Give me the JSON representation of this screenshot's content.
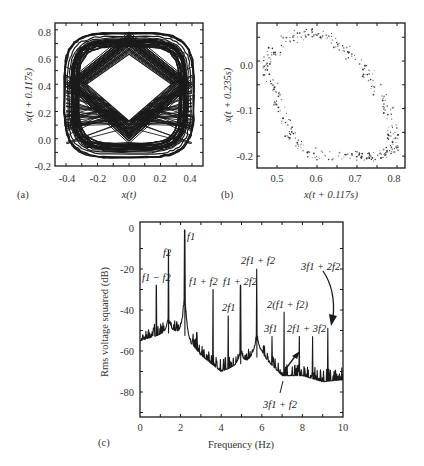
{
  "chart_data": [
    {
      "panel": "(a)",
      "type": "line",
      "title": "",
      "xlabel": "x(t)",
      "ylabel": "x(t + 0.117s)",
      "xlim": [
        -0.47,
        0.47
      ],
      "ylim": [
        -0.2,
        0.85
      ],
      "xticks": [
        "-0.4",
        "-0.2",
        "0.0",
        "0.2",
        "0.4"
      ],
      "yticks": [
        "-0.2",
        "0.0",
        "0.2",
        "0.4",
        "0.6",
        "0.8"
      ],
      "grid": false,
      "description": "Delay-coordinate phase portrait: dense quasi-periodic trajectory filling a rounded square band with a diamond-shaped empty center (vertices near (0,0.62), (0.27,0.4), (0,0.13), (-0.27,0.4))",
      "envelope": {
        "x_min": -0.42,
        "x_max": 0.42,
        "y_min": -0.15,
        "y_max": 0.81
      },
      "hole": [
        [
          0.0,
          0.62
        ],
        [
          0.27,
          0.4
        ],
        [
          0.0,
          0.13
        ],
        [
          -0.27,
          0.4
        ]
      ]
    },
    {
      "panel": "(b)",
      "type": "scatter",
      "title": "",
      "xlabel": "x(t + 0.117s)",
      "ylabel": "x(t + 0.235s)",
      "xlim": [
        0.45,
        0.82
      ],
      "ylim": [
        -0.225,
        0.08
      ],
      "xticks": [
        "0.5",
        "0.6",
        "0.7",
        "0.8"
      ],
      "yticks": [
        "-0.2",
        "-0.1",
        "0.0"
      ],
      "grid": false,
      "description": "Poincare section: scattered points forming a tilted closed ring (torus cross-section), densest near (0.77, -0.19)",
      "ring_points": [
        [
          0.48,
          0.0
        ],
        [
          0.5,
          0.03
        ],
        [
          0.54,
          0.05
        ],
        [
          0.58,
          0.06
        ],
        [
          0.62,
          0.05
        ],
        [
          0.66,
          0.03
        ],
        [
          0.7,
          0.0
        ],
        [
          0.74,
          -0.04
        ],
        [
          0.77,
          -0.09
        ],
        [
          0.79,
          -0.14
        ],
        [
          0.79,
          -0.18
        ],
        [
          0.76,
          -0.2
        ],
        [
          0.7,
          -0.2
        ],
        [
          0.63,
          -0.2
        ],
        [
          0.57,
          -0.19
        ],
        [
          0.54,
          -0.16
        ],
        [
          0.52,
          -0.12
        ],
        [
          0.5,
          -0.07
        ],
        [
          0.48,
          -0.03
        ]
      ]
    },
    {
      "panel": "(c)",
      "type": "line",
      "title": "",
      "xlabel": "Frequency (Hz)",
      "ylabel": "Rms voltage squared (dB)",
      "xlim": [
        0,
        10
      ],
      "ylim": [
        -92,
        2
      ],
      "xticks": [
        "0",
        "2",
        "4",
        "6",
        "8",
        "10"
      ],
      "yticks": [
        "0",
        "-20",
        "-40",
        "-60",
        "-80"
      ],
      "grid": false,
      "noise_floor": {
        "x": [
          0,
          1,
          2,
          3,
          4,
          5,
          6,
          7,
          8,
          9,
          10
        ],
        "y": [
          -55,
          -52,
          -50,
          -62,
          -70,
          -66,
          -62,
          -72,
          -72,
          -75,
          -74
        ]
      },
      "peaks": [
        {
          "label": "f1 - f2",
          "x": 0.8,
          "y": -28
        },
        {
          "label": "f2",
          "x": 1.4,
          "y": -11
        },
        {
          "label": "f1",
          "x": 2.2,
          "y": -1
        },
        {
          "label": "",
          "x": 2.8,
          "y": -51
        },
        {
          "label": "f1 + f2",
          "x": 3.6,
          "y": -30
        },
        {
          "label": "2f1",
          "x": 4.35,
          "y": -43
        },
        {
          "label": "f1 + 2f2",
          "x": 4.95,
          "y": -28
        },
        {
          "label": "2f1 + f2",
          "x": 5.75,
          "y": -20
        },
        {
          "label": "3f1",
          "x": 6.5,
          "y": -53
        },
        {
          "label": "2(f1 + f2)",
          "x": 7.1,
          "y": -41
        },
        {
          "label": "3f1 + f2",
          "x": 7.85,
          "y": -53
        },
        {
          "label": "2f1 + 3f2",
          "x": 8.5,
          "y": -53
        },
        {
          "label": "3f1 + 2f2",
          "x": 9.25,
          "y": -49
        }
      ]
    }
  ],
  "panels": {
    "a": {
      "letter": "(a)",
      "xlabel": "x(t)",
      "ylabel": "x(t + 0.117s)",
      "xticks": [
        "-0.4",
        "-0.2",
        "0.0",
        "0.2",
        "0.4"
      ],
      "yticks": [
        "-0.2",
        "0.0",
        "0.2",
        "0.4",
        "0.6",
        "0.8"
      ]
    },
    "b": {
      "letter": "(b)",
      "xlabel": "x(t + 0.117s)",
      "ylabel": "x(t + 0.235s)",
      "xticks": [
        "0.5",
        "0.6",
        "0.7",
        "0.8"
      ],
      "yticks": [
        "-0.2",
        "-0.1",
        "0.0"
      ]
    },
    "c": {
      "letter": "(c)",
      "xlabel": "Frequency (Hz)",
      "ylabel": "Rms voltage squared (dB)",
      "xticks": [
        "0",
        "2",
        "4",
        "6",
        "8",
        "10"
      ],
      "yticks": [
        "0",
        "-20",
        "-40",
        "-60",
        "-80"
      ],
      "annotations": {
        "f1m f2": "f1 − f2",
        "f2": "f2",
        "f1": "f1",
        "f1pf2": "f1 + f2",
        "f1p2f2": "f1 + 2f2",
        "2f1": "2f1",
        "2f1pf2": "2f1 + f2",
        "2f1pf2x2": "2(f1 + f2)",
        "3f1": "3f1",
        "2f1p3f2": "2f1 + 3f2",
        "3f1p2f2": "3f1 + 2f2",
        "3f1pf2": "3f1 + f2"
      }
    }
  },
  "colors": {
    "ink": "#1a1a1a",
    "text": "#333333",
    "background": "#ffffff"
  }
}
